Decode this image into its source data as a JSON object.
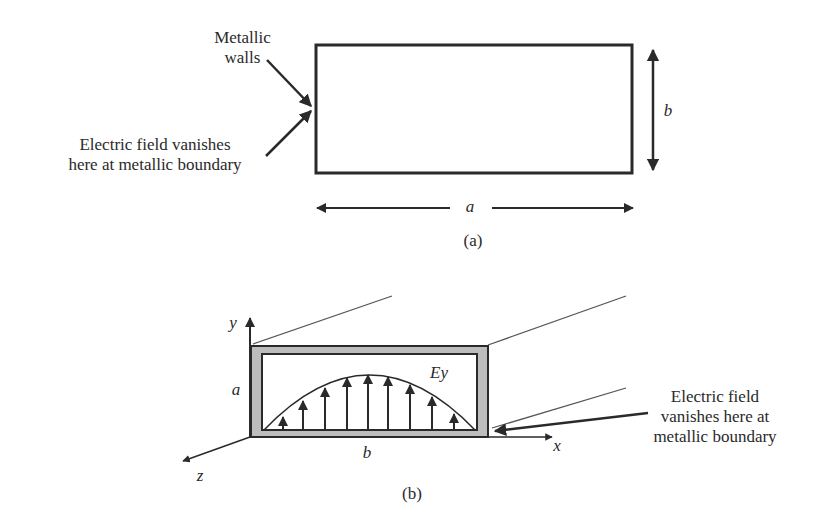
{
  "figure_a": {
    "caption": "(a)",
    "label_walls": [
      "Metallic",
      "walls"
    ],
    "label_field": [
      "Electric field vanishes",
      "here at metallic boundary"
    ],
    "dim_width": "a",
    "dim_height": "b"
  },
  "figure_b": {
    "caption": "(b)",
    "axis_y": "y",
    "axis_x": "x",
    "axis_z": "z",
    "dim_height": "a",
    "dim_width": "b",
    "field_label": "Ey",
    "label_field": [
      "Electric field",
      "vanishes here at",
      "metallic boundary"
    ]
  },
  "colors": {
    "ink": "#2a2a2a",
    "wall_fill": "#bdbdbd",
    "background": "#ffffff"
  }
}
